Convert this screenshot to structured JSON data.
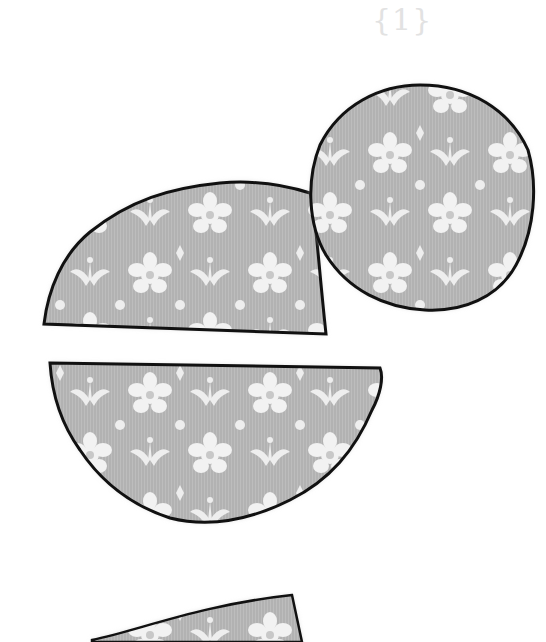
{
  "illustration": {
    "step_label": "{1}",
    "fabric_color": "#b4b4b4",
    "motif_color": "#f4f4f4",
    "outline_color": "#111111",
    "pieces": [
      {
        "name": "half-circle-top",
        "description": "upper half-circle fabric piece, flat edge at bottom"
      },
      {
        "name": "circle",
        "description": "round fabric piece with wavy outline"
      },
      {
        "name": "half-circle-bottom",
        "description": "lower half-circle fabric piece, flat edge at top"
      },
      {
        "name": "partial-piece",
        "description": "partially visible fabric piece at bottom edge"
      }
    ]
  }
}
